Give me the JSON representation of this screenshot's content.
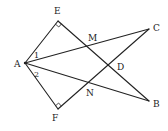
{
  "diagram": {
    "type": "geometry",
    "points": {
      "A": {
        "label": "A",
        "x": 25,
        "y": 63,
        "lx": 14,
        "ly": 67
      },
      "E": {
        "label": "E",
        "x": 58,
        "y": 21,
        "lx": 54,
        "ly": 14
      },
      "F": {
        "label": "F",
        "x": 58,
        "y": 109,
        "lx": 52,
        "ly": 121
      },
      "C": {
        "label": "C",
        "x": 149,
        "y": 29,
        "lx": 153,
        "ly": 31
      },
      "B": {
        "label": "B",
        "x": 149,
        "y": 101,
        "lx": 153,
        "ly": 107
      },
      "M": {
        "label": "M",
        "x": 90,
        "y": 46,
        "lx": 88,
        "ly": 41
      },
      "D": {
        "label": "D",
        "x": 112,
        "y": 66,
        "lx": 117,
        "ly": 70
      },
      "N": {
        "label": "N",
        "x": 90,
        "y": 84,
        "lx": 86,
        "ly": 96
      }
    },
    "angle_labels": {
      "angle1": {
        "label": "1",
        "x": 34,
        "y": 58
      },
      "angle2": {
        "label": "2",
        "x": 34,
        "y": 77
      }
    },
    "segments": [
      [
        "A",
        "E"
      ],
      [
        "A",
        "F"
      ],
      [
        "E",
        "B"
      ],
      [
        "F",
        "C"
      ],
      [
        "A",
        "C"
      ],
      [
        "A",
        "B"
      ]
    ],
    "right_angles": [
      "E",
      "F"
    ],
    "stroke_color": "#222222"
  }
}
